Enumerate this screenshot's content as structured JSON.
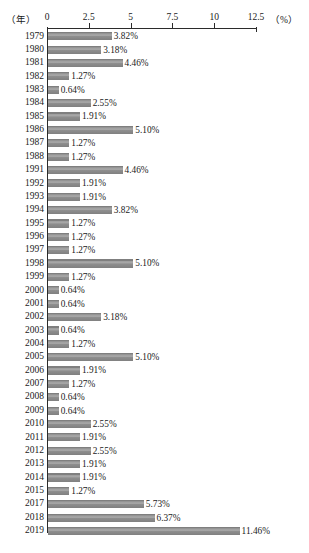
{
  "chart_data": {
    "type": "bar",
    "orientation": "horizontal",
    "title": "",
    "xlabel": "(%)",
    "ylabel": "（年）",
    "axis_unit_left": "（年）",
    "axis_unit_right": "（%）",
    "xlim": [
      0,
      12.5
    ],
    "grid": false,
    "legend": "none",
    "tick_labels": [
      "0",
      "2.5",
      "5",
      "7.5",
      "10",
      "12.5"
    ],
    "tick_values": [
      0,
      2.5,
      5,
      7.5,
      10,
      12.5
    ],
    "categories": [
      "1979",
      "1980",
      "1981",
      "1982",
      "1983",
      "1984",
      "1985",
      "1986",
      "1987",
      "1988",
      "1991",
      "1992",
      "1993",
      "1994",
      "1995",
      "1996",
      "1997",
      "1998",
      "1999",
      "2000",
      "2001",
      "2002",
      "2003",
      "2004",
      "2005",
      "2006",
      "2007",
      "2008",
      "2009",
      "2010",
      "2011",
      "2012",
      "2013",
      "2014",
      "2015",
      "2017",
      "2018",
      "2019"
    ],
    "values": [
      3.82,
      3.18,
      4.46,
      1.27,
      0.64,
      2.55,
      1.91,
      5.1,
      1.27,
      1.27,
      4.46,
      1.91,
      1.91,
      3.82,
      1.27,
      1.27,
      1.27,
      5.1,
      1.27,
      0.64,
      0.64,
      3.18,
      0.64,
      1.27,
      5.1,
      1.91,
      1.27,
      0.64,
      0.64,
      2.55,
      1.91,
      2.55,
      1.91,
      1.91,
      1.27,
      5.73,
      6.37,
      11.46
    ],
    "value_labels": [
      "3.82%",
      "3.18%",
      "4.46%",
      "1.27%",
      "0.64%",
      "2.55%",
      "1.91%",
      "5.10%",
      "1.27%",
      "1.27%",
      "4.46%",
      "1.91%",
      "1.91%",
      "3.82%",
      "1.27%",
      "1.27%",
      "1.27%",
      "5.10%",
      "1.27%",
      "0.64%",
      "0.64%",
      "3.18%",
      "0.64%",
      "1.27%",
      "5.10%",
      "1.91%",
      "1.27%",
      "0.64%",
      "0.64%",
      "2.55%",
      "1.91%",
      "2.55%",
      "1.91%",
      "1.91%",
      "1.27%",
      "5.73%",
      "6.37%",
      "11.46%"
    ],
    "bar_color": "#8a8a8a"
  }
}
